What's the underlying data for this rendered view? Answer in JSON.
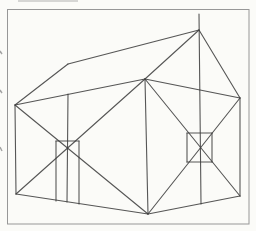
{
  "figure": {
    "colors": {
      "paper": "#fbfbf8",
      "frame": "#979797",
      "ink": "#3f3f3f",
      "artifact": "#8d8d8d"
    },
    "frame": {
      "x": 7.5,
      "y": 9.5,
      "width": 241.5,
      "height": 214.5
    },
    "ink_width": 1.1,
    "segments": [
      {
        "name": "roof-edge-left",
        "x1": 15,
        "y1": 105,
        "x2": 68,
        "y2": 64
      },
      {
        "name": "roof-ridge",
        "x1": 68,
        "y1": 64,
        "x2": 199,
        "y2": 30
      },
      {
        "name": "roof-edge-right",
        "x1": 199,
        "y1": 30,
        "x2": 240,
        "y2": 98
      },
      {
        "name": "roof-hip-front",
        "x1": 199,
        "y1": 30,
        "x2": 145,
        "y2": 79
      },
      {
        "name": "wall-top-left",
        "x1": 15,
        "y1": 105,
        "x2": 145,
        "y2": 79
      },
      {
        "name": "wall-top-right",
        "x1": 145,
        "y1": 79,
        "x2": 240,
        "y2": 98
      },
      {
        "name": "wall-edge-left",
        "x1": 15,
        "y1": 105,
        "x2": 16,
        "y2": 194
      },
      {
        "name": "wall-edge-front",
        "x1": 145,
        "y1": 79,
        "x2": 148,
        "y2": 214
      },
      {
        "name": "wall-edge-right",
        "x1": 240,
        "y1": 98,
        "x2": 240,
        "y2": 196
      },
      {
        "name": "wall-bottom-left",
        "x1": 16,
        "y1": 194,
        "x2": 148,
        "y2": 214
      },
      {
        "name": "wall-bottom-right",
        "x1": 148,
        "y1": 214,
        "x2": 240,
        "y2": 196
      },
      {
        "name": "left-wall-diagonal-a",
        "x1": 15,
        "y1": 105,
        "x2": 148,
        "y2": 214
      },
      {
        "name": "left-wall-diagonal-b",
        "x1": 16,
        "y1": 194,
        "x2": 145,
        "y2": 79
      },
      {
        "name": "right-wall-diagonal-a",
        "x1": 145,
        "y1": 79,
        "x2": 240,
        "y2": 196
      },
      {
        "name": "right-wall-diagonal-b",
        "x1": 148,
        "y1": 214,
        "x2": 240,
        "y2": 98
      },
      {
        "name": "apex-centre-vertical",
        "x1": 199,
        "y1": 14,
        "x2": 201,
        "y2": 204
      },
      {
        "name": "left-centre-vertical",
        "x1": 68,
        "y1": 94,
        "x2": 67,
        "y2": 202
      },
      {
        "name": "door-left-edge",
        "x1": 56,
        "y1": 141,
        "x2": 56,
        "y2": 201
      },
      {
        "name": "door-right-edge",
        "x1": 79,
        "y1": 141,
        "x2": 79,
        "y2": 204
      },
      {
        "name": "door-top-edge",
        "x1": 56,
        "y1": 141,
        "x2": 79,
        "y2": 141
      },
      {
        "name": "window-top-edge",
        "x1": 187,
        "y1": 133,
        "x2": 212,
        "y2": 133
      },
      {
        "name": "window-bottom-edge",
        "x1": 187,
        "y1": 162,
        "x2": 212,
        "y2": 162
      },
      {
        "name": "window-left-edge",
        "x1": 187,
        "y1": 133,
        "x2": 187,
        "y2": 162
      },
      {
        "name": "window-right-edge",
        "x1": 212,
        "y1": 133,
        "x2": 212,
        "y2": 162
      }
    ],
    "scan_artifacts": [
      {
        "name": "page-edge-tick-1",
        "x1": 0,
        "y1": 51,
        "x2": 2,
        "y2": 54,
        "opacity": 0.8
      },
      {
        "name": "page-edge-tick-2",
        "x1": 0,
        "y1": 90,
        "x2": 2,
        "y2": 93,
        "opacity": 0.8
      },
      {
        "name": "page-edge-tick-3",
        "x1": 0,
        "y1": 147,
        "x2": 2,
        "y2": 151,
        "opacity": 0.8
      },
      {
        "name": "page-top-smudge",
        "x1": 18,
        "y1": 1,
        "x2": 78,
        "y2": 1,
        "opacity": 0.45
      }
    ]
  }
}
